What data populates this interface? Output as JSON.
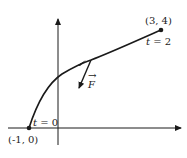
{
  "diagram": {
    "start_point": {
      "label": "(-1, 0)",
      "param": "t = 0",
      "param_var": "t",
      "param_value": "= 0"
    },
    "end_point": {
      "label": "(3, 4)",
      "param": "t = 2",
      "param_var": "t",
      "param_value": "= 2"
    },
    "force": {
      "label": "F",
      "vector_mark": "→"
    },
    "colors": {
      "stroke": "#1a1a1a",
      "background": "#ffffff"
    }
  }
}
